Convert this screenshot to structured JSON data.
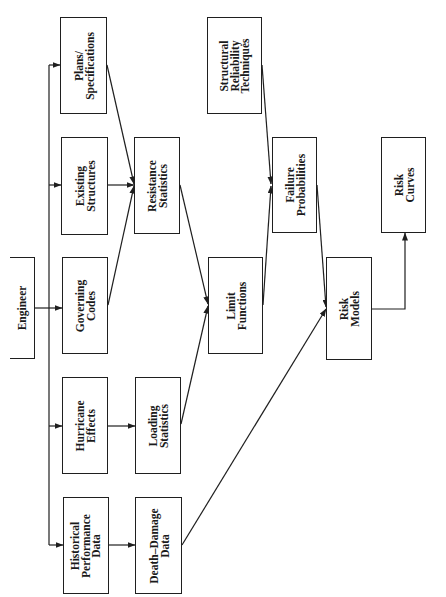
{
  "diagram": {
    "orientation": "rotated 90 degrees counterclockwise (text reads bottom-to-top)",
    "nodes": {
      "engineer": {
        "lines": [
          "Engineer"
        ]
      },
      "plans_specifications": {
        "lines": [
          "Plans/",
          "Specifications"
        ]
      },
      "existing_structures": {
        "lines": [
          "Existing",
          "Structures"
        ]
      },
      "governing_codes": {
        "lines": [
          "Governing",
          "Codes"
        ]
      },
      "hurricane_effects": {
        "lines": [
          "Hurricane",
          "Effects"
        ]
      },
      "historical_performance_data": {
        "lines": [
          "Historical",
          "Performance",
          "Data"
        ]
      },
      "resistance_statistics": {
        "lines": [
          "Resistance",
          "Statistics"
        ]
      },
      "loading_statistics": {
        "lines": [
          "Loading",
          "Statistics"
        ]
      },
      "death_damage_data": {
        "lines": [
          "Death–Damage",
          "Data"
        ]
      },
      "structural_reliability_techniques": {
        "lines": [
          "Structural",
          "Reliability",
          "Techniques"
        ]
      },
      "limit_functions": {
        "lines": [
          "Limit",
          "Functions"
        ]
      },
      "failure_probabilities": {
        "lines": [
          "Failure",
          "Probabilities"
        ]
      },
      "risk_models": {
        "lines": [
          "Risk",
          "Models"
        ]
      },
      "risk_curves": {
        "lines": [
          "Risk",
          "Curves"
        ]
      }
    },
    "edges": [
      {
        "from": "Engineer",
        "to": "Plans/Specifications"
      },
      {
        "from": "Engineer",
        "to": "Existing Structures"
      },
      {
        "from": "Engineer",
        "to": "Governing Codes"
      },
      {
        "from": "Engineer",
        "to": "Hurricane Effects"
      },
      {
        "from": "Engineer",
        "to": "Historical Performance Data"
      },
      {
        "from": "Plans/Specifications",
        "to": "Resistance Statistics"
      },
      {
        "from": "Existing Structures",
        "to": "Resistance Statistics"
      },
      {
        "from": "Governing Codes",
        "to": "Resistance Statistics"
      },
      {
        "from": "Hurricane Effects",
        "to": "Loading Statistics"
      },
      {
        "from": "Historical Performance Data",
        "to": "Death–Damage Data"
      },
      {
        "from": "Resistance Statistics",
        "to": "Limit Functions"
      },
      {
        "from": "Loading Statistics",
        "to": "Limit Functions"
      },
      {
        "from": "Structural Reliability Techniques",
        "to": "Failure Probabilities"
      },
      {
        "from": "Limit Functions",
        "to": "Failure Probabilities"
      },
      {
        "from": "Failure Probabilities",
        "to": "Risk Models"
      },
      {
        "from": "Death–Damage Data",
        "to": "Risk Models"
      },
      {
        "from": "Risk Models",
        "to": "Risk Curves"
      }
    ],
    "colors": {
      "line": "#1f1f1f",
      "background": "#ffffff",
      "text": "#1a1a1a"
    }
  }
}
